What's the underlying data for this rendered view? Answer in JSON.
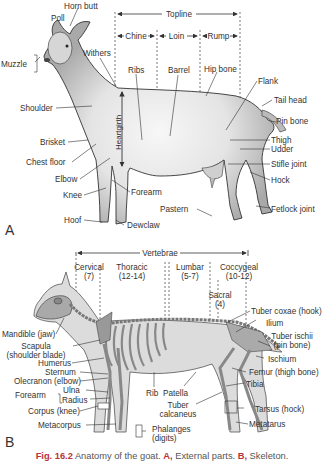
{
  "panel_a": {
    "letter": "A",
    "regions": {
      "topline": "Topline",
      "chine": "Chine",
      "loin": "Loin",
      "rump": "Rump"
    },
    "labels": {
      "horn_butt": "Horn butt",
      "poll": "Poll",
      "muzzle": "Muzzle",
      "withers": "Withers",
      "ribs": "Ribs",
      "barrel": "Barrel",
      "hip_bone": "Hip bone",
      "flank": "Flank",
      "tail_head": "Tail head",
      "pin_bone": "Pin bone",
      "shoulder": "Shoulder",
      "heartgirth": "Heartgirth",
      "brisket": "Brisket",
      "chest_floor": "Chest floor",
      "elbow": "Elbow",
      "knee": "Knee",
      "forearm": "Forearm",
      "hoof": "Hoof",
      "dewclaw": "Dewclaw",
      "thigh": "Thigh",
      "udder": "Udder",
      "stifle_joint": "Stifle joint",
      "hock": "Hock",
      "pastern": "Pastern",
      "fetlock_joint": "Fetlock joint"
    }
  },
  "panel_b": {
    "letter": "B",
    "vertebrae": {
      "title": "Vertebrae",
      "cervical": "Cervical",
      "cervical_count": "(7)",
      "thoracic": "Thoracic",
      "thoracic_count": "(12-14)",
      "lumbar": "Lumbar",
      "lumbar_count": "(5-7)",
      "sacral": "Sacral",
      "sacral_count": "(4)",
      "coccygeal": "Coccygeal",
      "coccygeal_count": "(10-12)"
    },
    "labels": {
      "mandible": "Mandible (jaw)",
      "scapula": "Scapula",
      "scapula_sub": "(shoulder blade)",
      "humerus": "Humerus",
      "sternum": "Sternum",
      "olecranon": "Olecranon (elbow)",
      "forearm": "Forearm",
      "ulna": "Ulna",
      "radius": "Radius",
      "corpus": "Corpus (knee)",
      "metacorpus": "Metacorpus",
      "rib": "Rib",
      "patella": "Patella",
      "tuber_calcaneus_1": "Tuber",
      "tuber_calcaneus_2": "calcaneus",
      "phalanges_1": "Phalanges",
      "phalanges_2": "(digits)",
      "tuber_coxae": "Tuber coxae (hook)",
      "ilium": "Ilium",
      "tuber_ischii_1": "Tuber ischii",
      "tuber_ischii_2": "(pin bone)",
      "ischium": "Ischium",
      "femur": "Femur (thigh bone)",
      "tibia": "Tibia",
      "tarsus": "Tarsus (hock)",
      "metatarus": "Metatarus"
    }
  },
  "caption": {
    "fig": "Fig. 16.2",
    "text1": " Anatomy of the goat. ",
    "a": "A,",
    "text2": " External parts. ",
    "b": "B,",
    "text3": " Skeleton."
  },
  "colors": {
    "line": "#333333",
    "body_fill": "#bdbdbd",
    "light_fill": "#ececec",
    "caption_accent": "#b8323a"
  }
}
